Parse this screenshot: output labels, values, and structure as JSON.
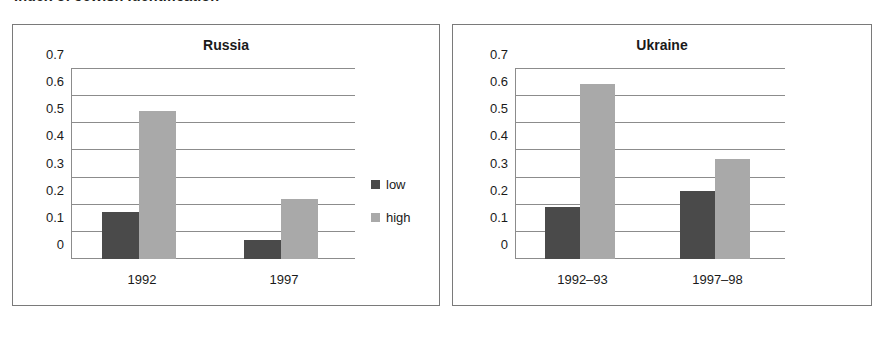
{
  "figure": {
    "title": "Index of Jewish Identification"
  },
  "colors": {
    "low": "#4a4a4a",
    "high": "#a9a9a9",
    "frame": "#7a7a7a",
    "grid": "#8c8c8c",
    "text": "#1a1a1a",
    "background": "#ffffff"
  },
  "chart_data": [
    {
      "type": "bar",
      "title": "Russia",
      "xlabel": "",
      "ylabel": "",
      "ylim": [
        0,
        0.7
      ],
      "yticks": [
        "0",
        "0.1",
        "0.2",
        "0.3",
        "0.4",
        "0.5",
        "0.6",
        "0.7"
      ],
      "ytick_values": [
        0,
        0.1,
        0.2,
        0.3,
        0.4,
        0.5,
        0.6,
        0.7
      ],
      "grid": true,
      "legend_position": "right",
      "categories": [
        "1992",
        "1997"
      ],
      "series": [
        {
          "name": "low",
          "values": [
            0.175,
            0.07
          ]
        },
        {
          "name": "high",
          "values": [
            0.545,
            0.22
          ]
        }
      ]
    },
    {
      "type": "bar",
      "title": "Ukraine",
      "xlabel": "",
      "ylabel": "",
      "ylim": [
        0,
        0.7
      ],
      "yticks": [
        "0",
        "0.1",
        "0.2",
        "0.3",
        "0.4",
        "0.5",
        "0.6",
        "0.7"
      ],
      "ytick_values": [
        0,
        0.1,
        0.2,
        0.3,
        0.4,
        0.5,
        0.6,
        0.7
      ],
      "grid": true,
      "legend_position": "right",
      "categories": [
        "1992–93",
        "1997–98"
      ],
      "series": [
        {
          "name": "low",
          "values": [
            0.19,
            0.25
          ]
        },
        {
          "name": "high",
          "values": [
            0.645,
            0.37
          ]
        }
      ]
    }
  ]
}
